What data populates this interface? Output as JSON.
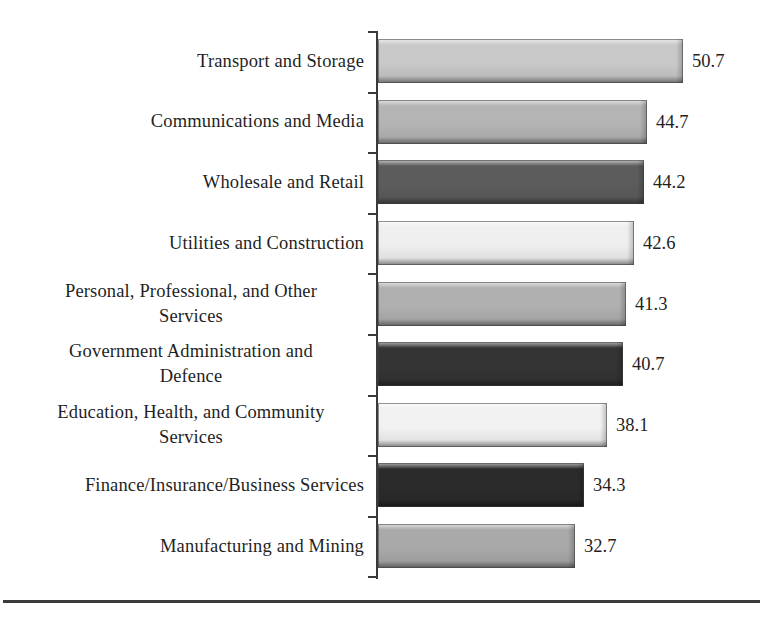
{
  "chart_data": {
    "type": "bar",
    "orientation": "horizontal",
    "title": "",
    "subtitle": "",
    "xlabel": "",
    "ylabel": "",
    "grid": false,
    "legend": false,
    "axis_line": true,
    "tick_marks": true,
    "value_labels_shown": true,
    "xlim": [
      0,
      50.7
    ],
    "categories": [
      "Transport and Storage",
      "Communications and Media",
      "Wholesale and  Retail",
      "Utilities and Construction",
      "Personal, Professional, and Other Services",
      "Government Administration and Defence",
      "Education, Health, and Community Services",
      "Finance/Insurance/Business Services",
      "Manufacturing and Mining"
    ],
    "values": [
      50.7,
      44.7,
      44.2,
      42.6,
      41.3,
      40.7,
      38.1,
      34.3,
      32.7
    ],
    "value_labels": [
      "50.7",
      "44.7",
      "44.2",
      "42.6",
      "41.3",
      "40.7",
      "38.1",
      "34.3",
      "32.7"
    ],
    "bar_colors": [
      "#c9c9c9",
      "#b4b4b4",
      "#5c5c5c",
      "#efefef",
      "#b0b0b0",
      "#343434",
      "#f2f2f2",
      "#2b2b2b",
      "#a9a9a9"
    ]
  },
  "rows": [
    {
      "label_lines": [
        "Transport and Storage"
      ],
      "value": "50.7",
      "color": "#c9c9c9"
    },
    {
      "label_lines": [
        "Communications and Media"
      ],
      "value": "44.7",
      "color": "#b4b4b4"
    },
    {
      "label_lines": [
        "Wholesale and  Retail"
      ],
      "value": "44.2",
      "color": "#5c5c5c"
    },
    {
      "label_lines": [
        "Utilities and Construction"
      ],
      "value": "42.6",
      "color": "#efefef"
    },
    {
      "label_lines": [
        "Personal, Professional, and Other",
        "Services"
      ],
      "value": "41.3",
      "color": "#b0b0b0"
    },
    {
      "label_lines": [
        "Government Administration and",
        "Defence"
      ],
      "value": "40.7",
      "color": "#343434"
    },
    {
      "label_lines": [
        "Education, Health, and Community",
        "Services"
      ],
      "value": "38.1",
      "color": "#f2f2f2"
    },
    {
      "label_lines": [
        "Finance/Insurance/Business Services"
      ],
      "value": "34.3",
      "color": "#2b2b2b"
    },
    {
      "label_lines": [
        "Manufacturing and Mining"
      ],
      "value": "32.7",
      "color": "#a9a9a9"
    }
  ],
  "style": {
    "axis_color": "#3a3a3a",
    "text_color": "#1f1f1f",
    "background": "#ffffff",
    "footer_rule_color": "#3b3b3b"
  }
}
